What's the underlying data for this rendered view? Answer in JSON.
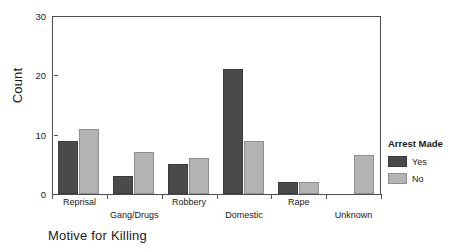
{
  "chart_data": {
    "type": "bar",
    "title": "",
    "xlabel": "Motive for Killing",
    "ylabel": "Count",
    "categories": [
      "Reprisal",
      "Gang/Drugs",
      "Robbery",
      "Domestic",
      "Rape",
      "Unknown"
    ],
    "series": [
      {
        "name": "Yes",
        "color": "#4a4a4a",
        "values": [
          9,
          3,
          5,
          21,
          2,
          0
        ]
      },
      {
        "name": "No",
        "color": "#b3b3b3",
        "values": [
          11,
          7,
          6,
          9,
          2,
          6.5
        ]
      }
    ],
    "ylim": [
      0,
      30
    ],
    "yticks": [
      0,
      10,
      20,
      30
    ],
    "ytick_labels": [
      "0",
      "10",
      "20",
      "30"
    ],
    "grid": false,
    "legend_position": "right",
    "legend_title": "Arrest Made"
  },
  "legend": {
    "title": "Arrest Made",
    "entries": [
      {
        "label": "Yes"
      },
      {
        "label": "No"
      }
    ]
  },
  "axes": {
    "y_title": "Count",
    "x_title": "Motive for Killing"
  }
}
